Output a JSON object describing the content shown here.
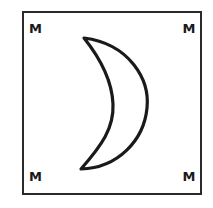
{
  "card": {
    "symbol": "crescent-moon",
    "corners": {
      "top_left": "M",
      "top_right": "M",
      "bottom_left": "M",
      "bottom_right": "M"
    }
  },
  "colors": {
    "stroke": "#1a1a1a",
    "background": "#ffffff"
  }
}
